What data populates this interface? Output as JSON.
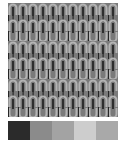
{
  "pattern": {
    "name": "loop-arch-seamless-pattern",
    "colors": {
      "background": "#7a7a7a",
      "loop_outline": "#b4b4b4",
      "loop_fill": "#2e2e2e",
      "bar": "#262626"
    }
  },
  "palette": {
    "swatches": [
      {
        "name": "swatch-1",
        "color": "#2b2b2b"
      },
      {
        "name": "swatch-2",
        "color": "#8b8b8b"
      },
      {
        "name": "swatch-3",
        "color": "#a3a3a3"
      },
      {
        "name": "swatch-4",
        "color": "#cdcdcd"
      },
      {
        "name": "swatch-5",
        "color": "#a9a9a9"
      }
    ]
  }
}
